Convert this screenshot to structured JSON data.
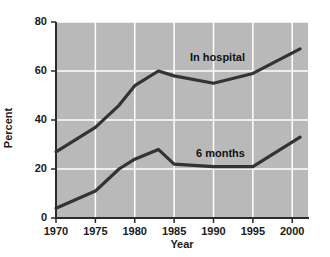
{
  "chart_data": {
    "type": "line",
    "title": "",
    "subtitle": "",
    "xlabel": "Year",
    "ylabel": "Percent",
    "xlim": [
      1970,
      2002
    ],
    "ylim": [
      0,
      80
    ],
    "xticks": [
      1970,
      1975,
      1980,
      1985,
      1990,
      1995,
      2000
    ],
    "yticks": [
      0,
      20,
      40,
      60,
      80
    ],
    "xtick_labels": [
      "1970",
      "1975",
      "1980",
      "1985",
      "1990",
      "1995",
      "2000"
    ],
    "ytick_labels": [
      "0",
      "20",
      "40",
      "60",
      "80"
    ],
    "grid": true,
    "grid_color": "#ffffff",
    "plot_background": "#b9b9b9",
    "legend_position": "inline-annotations",
    "series": [
      {
        "name": "In hospital",
        "color": "#333333",
        "label_text": "In hospital",
        "x": [
          1970,
          1975,
          1978,
          1980,
          1983,
          1985,
          1990,
          1995,
          2001
        ],
        "values": [
          27,
          37,
          46,
          54,
          60,
          58,
          55,
          59,
          69
        ]
      },
      {
        "name": "6 months",
        "color": "#333333",
        "label_text": "6 months",
        "x": [
          1970,
          1975,
          1978,
          1980,
          1983,
          1985,
          1990,
          1995,
          2001
        ],
        "values": [
          4,
          11,
          20,
          24,
          28,
          22,
          21,
          21,
          33
        ]
      }
    ]
  }
}
